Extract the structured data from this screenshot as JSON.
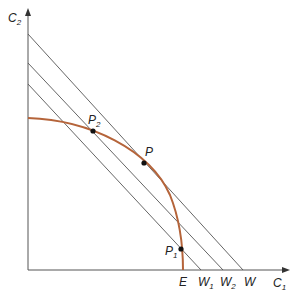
{
  "axes": {
    "x_label": "C",
    "x_sub": "1",
    "y_label": "C",
    "y_sub": "2"
  },
  "curve": {
    "name": "production possibility frontier",
    "color": "#b5643a",
    "start": [
      28,
      118
    ],
    "end": [
      183,
      270
    ]
  },
  "budget_lines": [
    {
      "label": "W",
      "sub": "",
      "y_intercept_px": 34,
      "x_intercept_px": 243
    },
    {
      "label": "W",
      "sub": "2",
      "y_intercept_px": 63,
      "x_intercept_px": 223
    },
    {
      "label": "W",
      "sub": "1",
      "y_intercept_px": 84,
      "x_intercept_px": 201
    }
  ],
  "points": [
    {
      "label": "P",
      "sub": "",
      "x": 144,
      "y": 163
    },
    {
      "label": "P",
      "sub": "2",
      "x": 93,
      "y": 131
    },
    {
      "label": "P",
      "sub": "1",
      "x": 181,
      "y": 249
    }
  ],
  "x_axis_labels": {
    "E": "E",
    "W1": "W",
    "W1_sub": "1",
    "W2": "W",
    "W2_sub": "2",
    "W": "W"
  },
  "colors": {
    "axis": "#555555",
    "lines": "#555555",
    "curve": "#b5643a",
    "points": "#111111"
  }
}
